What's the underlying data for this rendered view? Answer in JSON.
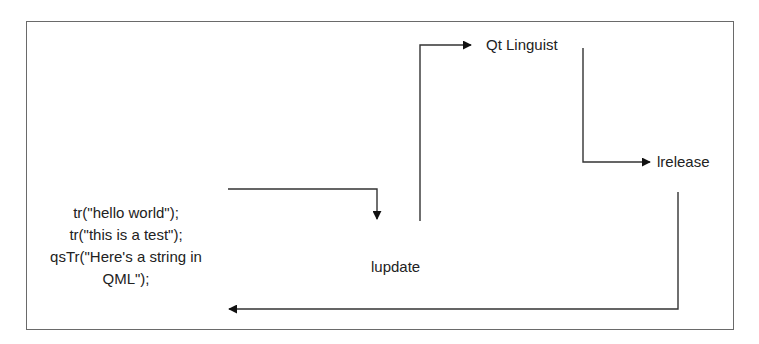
{
  "diagram": {
    "source_code": {
      "lines": [
        "tr(\"hello world\");",
        "tr(\"this is a test\");",
        "qsTr(\"Here's a string in",
        "QML\");"
      ]
    },
    "nodes": {
      "lupdate": "lupdate",
      "linguist": "Qt Linguist",
      "lrelease": "lrelease"
    },
    "edges": [
      {
        "from": "source_code",
        "to": "lupdate"
      },
      {
        "from": "lupdate",
        "to": "linguist"
      },
      {
        "from": "linguist",
        "to": "lrelease"
      },
      {
        "from": "lrelease",
        "to": "source_code"
      }
    ],
    "colors": {
      "frame": "#6a6a6a",
      "line": "#333333",
      "text": "#222222"
    }
  }
}
